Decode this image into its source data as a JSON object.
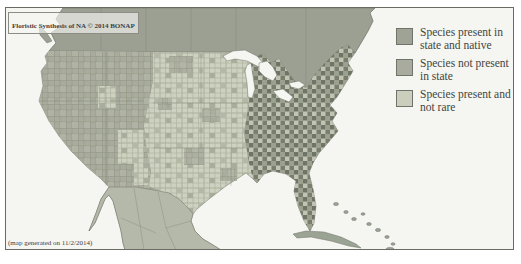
{
  "figure": {
    "title": "Floristic Synthesis of NA © 2014 BONAP",
    "footer": "(map generated on 11/2/2014)"
  },
  "legend": {
    "items": [
      {
        "label": "Species present in state and native",
        "color": "#9fa396"
      },
      {
        "label": "Species not present in state",
        "color": "#a8ab9e"
      },
      {
        "label": "Species present and not rare",
        "color": "#cbcebd"
      }
    ]
  },
  "map": {
    "colors": {
      "ocean": "#f5f5f1",
      "canada": "#9ba093",
      "mexico": "#b5b9aa",
      "islands": "#9aa394",
      "lakes": "#f5f5f1"
    }
  }
}
